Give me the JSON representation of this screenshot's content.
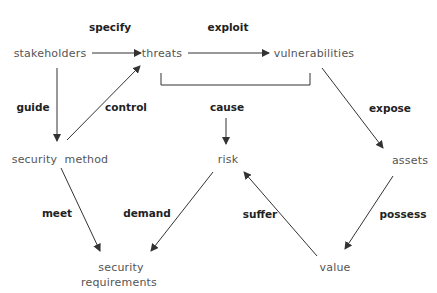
{
  "nodes": {
    "stakeholders": "stakeholders",
    "threats": "threats",
    "vulnerabilities": "vulnerabilities",
    "security_method": "security  method",
    "risk": "risk",
    "assets": "assets",
    "value": "value",
    "security_requirements_line1": "security",
    "security_requirements_line2": "requirements"
  },
  "relations": {
    "specify": "specify",
    "exploit": "exploit",
    "guide": "guide",
    "control": "control",
    "cause": "cause",
    "expose": "expose",
    "meet": "meet",
    "demand": "demand",
    "suffer": "suffer",
    "possess": "possess"
  },
  "colors": {
    "edge": "#333333",
    "node_text": "#555555",
    "label_text": "#222222",
    "background": "#ffffff"
  }
}
